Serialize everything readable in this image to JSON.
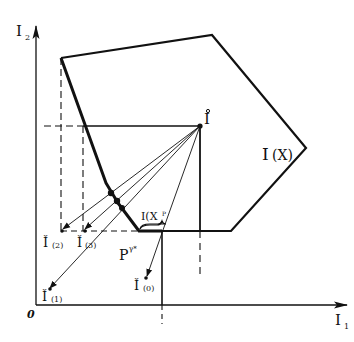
{
  "diagram": {
    "type": "geometric-construction",
    "colors": {
      "ink": "#111111",
      "background": "#ffffff"
    },
    "axes": {
      "x_label": "I",
      "x_sub": "1",
      "y_label": "I",
      "y_sub": "2",
      "origin_label": "0"
    },
    "region": {
      "label": "I(X)",
      "label_main": "I",
      "label_paren": "(X)"
    },
    "ideal_point": {
      "label": "Î",
      "glyph": "I",
      "accent": "°"
    },
    "reference_points": [
      {
        "id": "0",
        "label": "Ǐ(0)",
        "main": "Ǐ",
        "sub": "(0)"
      },
      {
        "id": "1",
        "label": "Ǐ(1)",
        "main": "Ǐ",
        "sub": "(1)"
      },
      {
        "id": "2",
        "label": "Ǐ(2)",
        "main": "Ǐ",
        "sub": "(2)"
      },
      {
        "id": "3",
        "label": "Ǐ(3)",
        "main": "Ǐ",
        "sub": "(3)"
      }
    ],
    "pareto_label": "P",
    "pareto_sup": "γ*",
    "subset_label": "I(X",
    "subset_sup": "P",
    "subset_close": ")"
  }
}
